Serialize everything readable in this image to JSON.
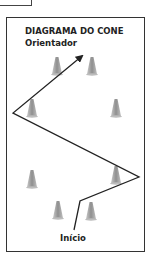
{
  "title": {
    "line1": "DIAGRAMA DO CONE",
    "line2": "Orientador"
  },
  "start_label": "Início",
  "colors": {
    "cone": "#a9a9a9",
    "line": "#222222",
    "border": "#333333"
  },
  "cones": [
    {
      "x": 57,
      "y": 66
    },
    {
      "x": 92,
      "y": 66
    },
    {
      "x": 32,
      "y": 108
    },
    {
      "x": 116,
      "y": 108
    },
    {
      "x": 32,
      "y": 179
    },
    {
      "x": 116,
      "y": 175
    },
    {
      "x": 58,
      "y": 210
    },
    {
      "x": 91,
      "y": 211
    }
  ],
  "path": [
    [
      74,
      230
    ],
    [
      80,
      201
    ],
    [
      139,
      177
    ],
    [
      13,
      113
    ],
    [
      82,
      56
    ]
  ]
}
